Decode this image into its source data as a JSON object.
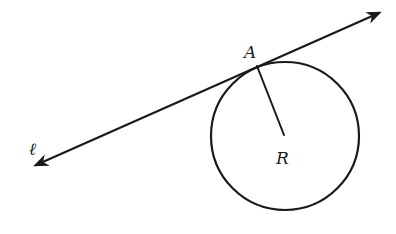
{
  "diagram": {
    "colors": {
      "ink": "#1a1a1a",
      "background": "#ffffff"
    },
    "line": {
      "name": "ℓ",
      "from": {
        "x": 36,
        "y": 165
      },
      "to": {
        "x": 379,
        "y": 13
      },
      "arrows": "both"
    },
    "circle": {
      "center_label": "R",
      "cx": 285,
      "cy": 136,
      "r": 74
    },
    "tangent_point": {
      "label": "A",
      "x": 257,
      "y": 66
    },
    "radius_segment": {
      "from": "A",
      "to": "R",
      "x1": 257,
      "y1": 66,
      "x2": 284,
      "y2": 135
    },
    "labels": {
      "line": "ℓ",
      "point_a": "A",
      "center": "R"
    }
  }
}
